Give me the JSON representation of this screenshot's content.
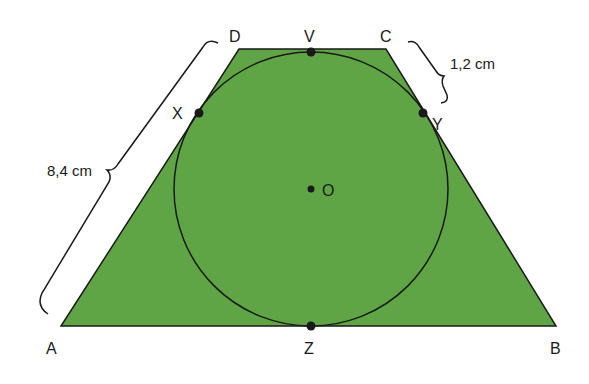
{
  "figure": {
    "colors": {
      "trapezoid_fill": "#5fa545",
      "stroke": "#1a1a1a",
      "background": "#ffffff"
    },
    "points": {
      "A": "A",
      "B": "B",
      "C": "C",
      "D": "D",
      "V": "V",
      "X": "X",
      "Y": "Y",
      "Z": "Z",
      "O": "O"
    },
    "measures": {
      "AD": "8,4 cm",
      "CY": "1,2 cm"
    }
  }
}
